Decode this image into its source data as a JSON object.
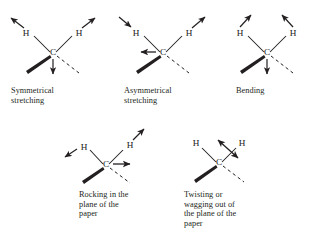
{
  "figure": {
    "background_color": "#ffffff",
    "ink_color": "#231f20"
  },
  "panels": [
    {
      "id": "symmetrical-stretching",
      "caption": "Symmetrical\nstretching",
      "atoms": {
        "center": "C",
        "left": "H",
        "right": "H"
      },
      "arrows": [
        {
          "name": "left-h-arrow",
          "direction": "up-left",
          "style": "single"
        },
        {
          "name": "right-h-arrow",
          "direction": "up-right",
          "style": "single"
        },
        {
          "name": "center-down-arrow",
          "direction": "down",
          "style": "single"
        }
      ],
      "bonds": [
        {
          "name": "wedge-bond",
          "type": "wedge",
          "direction": "down-left"
        },
        {
          "name": "dashed-bond",
          "type": "dashed",
          "direction": "down-right"
        }
      ]
    },
    {
      "id": "asymmetrical-stretching",
      "caption": "Asymmetrical\nstretching",
      "atoms": {
        "center": "C",
        "left": "H",
        "right": "H"
      },
      "arrows": [
        {
          "name": "left-h-arrow",
          "direction": "down-right",
          "style": "single"
        },
        {
          "name": "right-h-arrow",
          "direction": "up-right",
          "style": "single"
        },
        {
          "name": "center-left-arrow",
          "direction": "left",
          "style": "single"
        }
      ],
      "bonds": [
        {
          "name": "wedge-bond",
          "type": "wedge",
          "direction": "down-left"
        },
        {
          "name": "dashed-bond",
          "type": "dashed",
          "direction": "down-right"
        }
      ]
    },
    {
      "id": "bending",
      "caption": "Bending",
      "atoms": {
        "center": "C",
        "left": "H",
        "right": "H"
      },
      "arrows": [
        {
          "name": "left-h-arrow",
          "direction": "up-right",
          "style": "single"
        },
        {
          "name": "right-h-arrow",
          "direction": "up-left",
          "style": "single"
        },
        {
          "name": "center-down-arrow",
          "direction": "down",
          "style": "single"
        }
      ],
      "bonds": [
        {
          "name": "wedge-bond",
          "type": "wedge",
          "direction": "down-left"
        },
        {
          "name": "dashed-bond",
          "type": "dashed",
          "direction": "down-right"
        }
      ]
    },
    {
      "id": "rocking",
      "caption": "Rocking in the\nplane of the\npaper",
      "atoms": {
        "center": "C",
        "left": "H",
        "right": "H"
      },
      "arrows": [
        {
          "name": "left-h-arrow",
          "direction": "down-left",
          "style": "single"
        },
        {
          "name": "right-h-arrow",
          "direction": "up-right",
          "style": "single"
        },
        {
          "name": "center-right-arrow",
          "direction": "right",
          "style": "single"
        }
      ],
      "bonds": [
        {
          "name": "wedge-bond",
          "type": "wedge",
          "direction": "down-left"
        },
        {
          "name": "dashed-bond",
          "type": "dashed",
          "direction": "down-right"
        }
      ]
    },
    {
      "id": "twisting",
      "caption": "Twisting or\nwagging out of\nthe plane of the\npaper",
      "atoms": {
        "center": "C",
        "left": "H",
        "right": "H"
      },
      "arrows": [
        {
          "name": "twist-double-arrow",
          "direction": "up-left-and-down-right",
          "style": "double"
        }
      ],
      "bonds": [
        {
          "name": "wedge-bond",
          "type": "wedge",
          "direction": "down-left"
        },
        {
          "name": "dashed-bond",
          "type": "dashed",
          "direction": "down-right"
        }
      ]
    }
  ]
}
